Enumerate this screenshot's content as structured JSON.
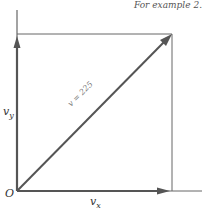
{
  "header": {
    "caption": "For example 2."
  },
  "diagram": {
    "type": "vector-components",
    "origin_label": "O",
    "x_component_label": "v",
    "x_component_sub": "x",
    "y_component_label": "v",
    "y_component_sub": "y",
    "resultant_label": "v = 225",
    "stroke_color": "#555555",
    "background": "#ffffff"
  }
}
